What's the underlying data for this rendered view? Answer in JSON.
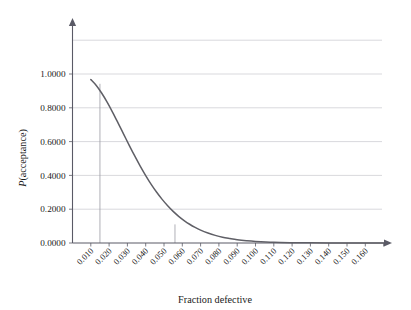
{
  "chart_data": {
    "type": "line",
    "title": "",
    "xlabel": "Fraction defective",
    "ylabel": "P(acceptance)",
    "ylabel_italic_prefix": "P",
    "ylabel_rest": "(acceptance)",
    "xlim": [
      0.0,
      0.178
    ],
    "ylim": [
      0.0,
      1.26
    ],
    "grid": true,
    "grid_axis": "y",
    "legend": "none",
    "y_ticks": [
      0.0,
      0.2,
      0.4,
      0.6,
      0.8,
      1.0
    ],
    "y_tick_labels": [
      "0.0000",
      "0.2000",
      "0.4000",
      "0.6000",
      "0.8000",
      "1.0000"
    ],
    "y_gridlines_unlabeled": [
      1.2
    ],
    "x_ticks": [
      0.01,
      0.02,
      0.03,
      0.04,
      0.05,
      0.06,
      0.07,
      0.08,
      0.09,
      0.1,
      0.11,
      0.12,
      0.13,
      0.14,
      0.15,
      0.16
    ],
    "x_tick_labels": [
      "0.010",
      "0.020",
      "0.030",
      "0.040",
      "0.050",
      "0.060",
      "0.070",
      "0.080",
      "0.090",
      "0.100",
      "0.110",
      "0.120",
      "0.130",
      "0.140",
      "0.150",
      "0.160"
    ],
    "x_extra_unlabeled_ticks": [
      0.17
    ],
    "x_tick_label_rotation": -45,
    "series": [
      {
        "name": "P(acceptance)",
        "color": "#5f5f66",
        "x": [
          0.01,
          0.013,
          0.016,
          0.019,
          0.022,
          0.025,
          0.028,
          0.031,
          0.034,
          0.037,
          0.04,
          0.043,
          0.046,
          0.049,
          0.052,
          0.055,
          0.058,
          0.061,
          0.064,
          0.067,
          0.07,
          0.074,
          0.078,
          0.082,
          0.086,
          0.09,
          0.095,
          0.1,
          0.11,
          0.12,
          0.13,
          0.14,
          0.15,
          0.16,
          0.17
        ],
        "y": [
          0.967,
          0.932,
          0.886,
          0.832,
          0.772,
          0.708,
          0.643,
          0.578,
          0.515,
          0.455,
          0.399,
          0.347,
          0.3,
          0.258,
          0.22,
          0.187,
          0.158,
          0.133,
          0.111,
          0.092,
          0.076,
          0.059,
          0.045,
          0.034,
          0.026,
          0.019,
          0.013,
          0.009,
          0.004,
          0.002,
          0.001,
          0.0004,
          0.0002,
          0.0001,
          0.0
        ]
      }
    ],
    "reference_lines": [
      {
        "name": "aql-reference",
        "x": 0.015,
        "y_from": 0.0,
        "y_to": 0.942,
        "color": "#9a9aa4"
      },
      {
        "name": "ltpd-reference",
        "x": 0.056,
        "y_from": 0.0,
        "y_to": 0.11,
        "color": "#9a9aa4"
      }
    ],
    "axis_arrows": {
      "x": true,
      "y": true
    }
  }
}
